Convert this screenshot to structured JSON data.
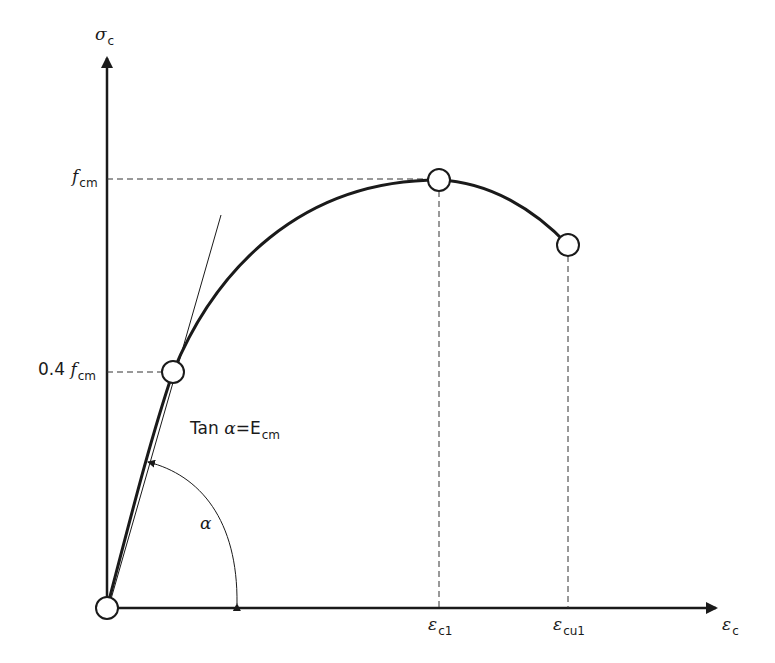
{
  "diagram": {
    "axes": {
      "y_axis": {
        "symbol": "σ",
        "subscript": "c"
      },
      "x_axis": {
        "symbol": "ε",
        "subscript": "c"
      }
    },
    "y_labels": [
      {
        "id": "fcm",
        "prefix": "",
        "symbol": "f",
        "subscript": "cm"
      },
      {
        "id": "0.4fcm",
        "prefix": "0.4 ",
        "symbol": "f",
        "subscript": "cm"
      }
    ],
    "x_labels": [
      {
        "id": "ec1",
        "symbol": "ε",
        "subscript": "c1"
      },
      {
        "id": "ecu1",
        "symbol": "ε",
        "subscript": "cu1"
      }
    ],
    "annotations": {
      "tangent": {
        "text_prefix": "Tan ",
        "symbol": "α",
        "equals": "=",
        "modulus": "E",
        "modulus_subscript": "cm"
      },
      "angle": {
        "symbol": "α"
      }
    },
    "points": [
      {
        "name": "origin"
      },
      {
        "name": "0.4 fcm point"
      },
      {
        "name": "peak (εc1, fcm)"
      },
      {
        "name": "ultimate (εcu1)"
      }
    ],
    "colors": {
      "line": "#1a1a1a",
      "background": "#ffffff"
    }
  }
}
